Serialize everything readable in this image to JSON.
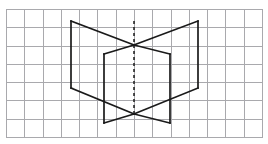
{
  "canvas": {
    "width": 268,
    "height": 144,
    "background_color": "#ffffff",
    "title": "Open-book folded prism figure on graph paper"
  },
  "grid": {
    "label": "graph-paper-grid",
    "columns": 14,
    "rows": 7,
    "cell_size": 18.3,
    "origin_x": 6,
    "origin_y": 9,
    "right": 262,
    "bottom": 137,
    "line_color": "#a9a9ad",
    "line_width": 1,
    "border": true
  },
  "figure": {
    "name": "open-book-figure",
    "stroke_color": "#1a1a1a",
    "stroke_width": 1.7,
    "vertices": {
      "top_left": [
        71,
        21
      ],
      "top_right": [
        198,
        21
      ],
      "wing_bottom_left": [
        71,
        88
      ],
      "wing_bottom_right": [
        198,
        88
      ],
      "panel_top_left": [
        104,
        54
      ],
      "panel_top_right": [
        170,
        54
      ],
      "panel_bottom_left": [
        104,
        123
      ],
      "panel_bottom_right": [
        170,
        123
      ],
      "apex_top": [
        134,
        45
      ],
      "apex_bottom": [
        134,
        114
      ]
    },
    "segments": [
      {
        "name": "left-wing-vertical",
        "from": [
          71,
          21
        ],
        "to": [
          71,
          88
        ]
      },
      {
        "name": "right-wing-vertical",
        "from": [
          198,
          21
        ],
        "to": [
          198,
          88
        ]
      },
      {
        "name": "left-panel-vertical",
        "from": [
          104,
          54
        ],
        "to": [
          104,
          123
        ]
      },
      {
        "name": "right-panel-vertical",
        "from": [
          170,
          54
        ],
        "to": [
          170,
          123
        ]
      },
      {
        "name": "top-left-edge-to-apex",
        "from": [
          71,
          21
        ],
        "to": [
          134,
          45
        ]
      },
      {
        "name": "top-right-edge-to-apex",
        "from": [
          198,
          21
        ],
        "to": [
          134,
          45
        ]
      },
      {
        "name": "apex-to-panel-top-left",
        "from": [
          134,
          45
        ],
        "to": [
          104,
          54
        ]
      },
      {
        "name": "apex-to-panel-top-right",
        "from": [
          134,
          45
        ],
        "to": [
          170,
          54
        ]
      },
      {
        "name": "wing-bottom-left-to-apex",
        "from": [
          71,
          88
        ],
        "to": [
          134,
          114
        ]
      },
      {
        "name": "wing-bottom-right-to-apex",
        "from": [
          198,
          88
        ],
        "to": [
          134,
          114
        ]
      },
      {
        "name": "apex-bottom-to-panel-bottom-left",
        "from": [
          134,
          114
        ],
        "to": [
          104,
          123
        ]
      },
      {
        "name": "apex-bottom-to-panel-bottom-right",
        "from": [
          134,
          114
        ],
        "to": [
          170,
          123
        ]
      }
    ]
  },
  "symmetry_axis": {
    "name": "vertical-dashed-symmetry-axis",
    "x": 134,
    "y_top": 21,
    "y_bottom": 116,
    "dash_pattern": "3 3",
    "stroke_color": "#1a1a1a",
    "stroke_width": 1.5
  }
}
